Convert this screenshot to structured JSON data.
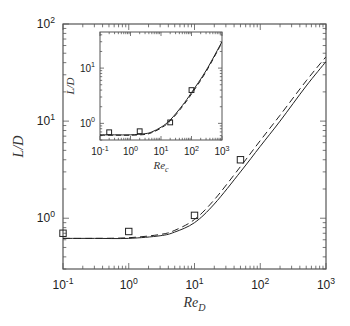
{
  "chart_data": [
    {
      "panel": "main",
      "type": "line",
      "title": "",
      "xlabel": "Re_D",
      "ylabel": "L/D",
      "xscale": "log",
      "yscale": "log",
      "xlim": [
        0.1,
        1000
      ],
      "ylim": [
        0.3,
        100
      ],
      "xticks": [
        "10^-1",
        "10^0",
        "10^1",
        "10^2",
        "10^3"
      ],
      "yticks": [
        "10^0",
        "10^1",
        "10^2"
      ],
      "grid": false,
      "legend": null,
      "series": [
        {
          "name": "model (solid)",
          "style": "solid",
          "x": [
            0.1,
            0.3,
            1,
            3,
            5,
            10,
            20,
            50,
            100,
            200,
            500,
            1000
          ],
          "y": [
            0.62,
            0.62,
            0.62,
            0.66,
            0.72,
            0.9,
            1.4,
            3.0,
            5.5,
            10,
            23,
            41
          ]
        },
        {
          "name": "model (dashed)",
          "style": "dashed",
          "x": [
            0.1,
            0.3,
            1,
            3,
            5,
            10,
            20,
            50,
            100,
            200,
            500,
            1000
          ],
          "y": [
            0.62,
            0.62,
            0.63,
            0.68,
            0.75,
            0.97,
            1.55,
            3.4,
            6.3,
            11.5,
            26,
            46
          ]
        },
        {
          "name": "data (squares)",
          "style": "markers",
          "marker": "square",
          "x": [
            0.1,
            1,
            10,
            50
          ],
          "y": [
            0.7,
            0.73,
            1.07,
            4.0
          ]
        }
      ]
    },
    {
      "panel": "inset",
      "type": "line",
      "title": "",
      "xlabel": "Re_c",
      "ylabel": "L/D",
      "xscale": "log",
      "yscale": "log",
      "xlim": [
        0.1,
        1000
      ],
      "ylim": [
        0.5,
        45
      ],
      "xticks": [
        "10^-1",
        "10^0",
        "10^1",
        "10^2",
        "10^3"
      ],
      "yticks": [
        "10^0",
        "10^1"
      ],
      "grid": false,
      "legend": null,
      "series": [
        {
          "name": "model (solid)",
          "style": "solid",
          "x": [
            0.1,
            0.3,
            1,
            3,
            5,
            10,
            20,
            50,
            100,
            300,
            1000
          ],
          "y": [
            0.62,
            0.62,
            0.62,
            0.65,
            0.7,
            0.85,
            1.15,
            2.1,
            3.6,
            9,
            30
          ]
        },
        {
          "name": "model (dashed)",
          "style": "dashed",
          "x": [
            0.1,
            0.3,
            1,
            3,
            5,
            10,
            20,
            50,
            100,
            300,
            1000
          ],
          "y": [
            0.61,
            0.61,
            0.61,
            0.63,
            0.68,
            0.82,
            1.1,
            2.0,
            3.4,
            8.6,
            29
          ]
        },
        {
          "name": "data (squares)",
          "style": "markers",
          "marker": "square",
          "x": [
            0.2,
            2,
            20,
            100
          ],
          "y": [
            0.69,
            0.72,
            1.04,
            4.0
          ]
        }
      ]
    }
  ],
  "labels": {
    "main_xlabel_base": "Re",
    "main_xlabel_sub": "D",
    "main_ylabel": "L/D",
    "inset_xlabel_base": "Re",
    "inset_xlabel_sub": "c",
    "inset_ylabel": "L/D",
    "x_tick_bases": [
      "10",
      "10",
      "10",
      "10",
      "10"
    ],
    "x_tick_exps": [
      "-1",
      "0",
      "1",
      "2",
      "3"
    ],
    "main_y_tick_exps": [
      "0",
      "1",
      "2"
    ],
    "inset_y_tick_exps": [
      "0",
      "1"
    ]
  }
}
